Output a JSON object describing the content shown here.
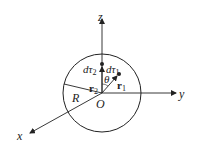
{
  "diagram": {
    "axes": {
      "x": "x",
      "y": "y",
      "z": "z"
    },
    "labels": {
      "origin": "O",
      "radius": "R",
      "theta": "θ",
      "dtau1_d": "d",
      "dtau1_tau": "τ",
      "dtau1_sub": "1",
      "dtau2_d": "d",
      "dtau2_tau": "τ",
      "dtau2_sub": "2",
      "r1": "r",
      "r1_sub": "1",
      "r2": "r",
      "r2_sub": "2"
    },
    "colors": {
      "stroke": "#222222",
      "background": "#ffffff"
    }
  }
}
